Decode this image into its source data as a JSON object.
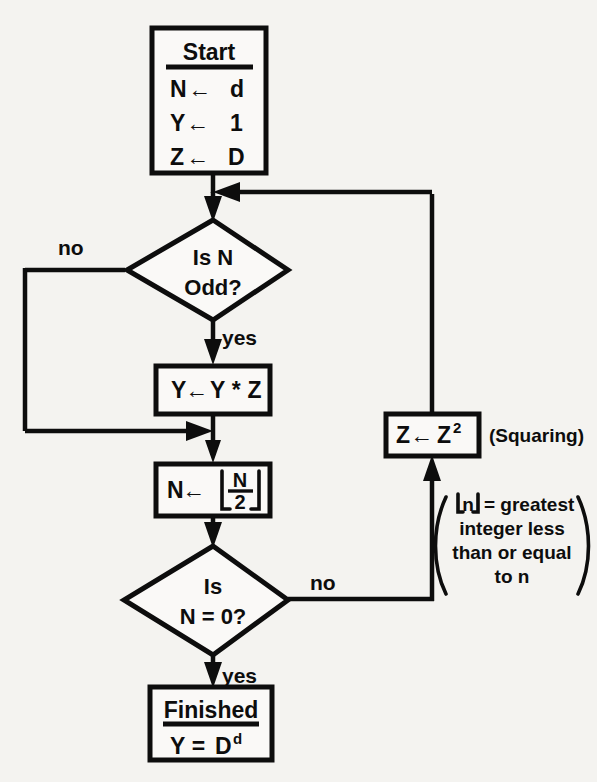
{
  "diagram": {
    "colors": {
      "background": "#f4f3f0",
      "ink": "#0d0d0d",
      "shape_fill": "#faf9f7"
    },
    "nodes": {
      "start": {
        "header": "Start",
        "lines": [
          "N",
          "d",
          "Y",
          "1",
          "Z",
          "D"
        ],
        "line1_left": "N",
        "line1_right": "d",
        "line2_left": "Y",
        "line2_right": "1",
        "line3_left": "Z",
        "line3_right": "D",
        "arrow_glyph": "←"
      },
      "decision_odd": {
        "line1": "Is N",
        "line2": "Odd?",
        "yes_label": "yes",
        "no_label": "no"
      },
      "multiply": {
        "left": "Y",
        "arrow_glyph": "←",
        "right": "Y * Z"
      },
      "halve": {
        "left": "N",
        "arrow_glyph": "←",
        "numerator": "N",
        "denominator": "2"
      },
      "decision_zero": {
        "line1": "Is",
        "line2": "N = 0?",
        "yes_label": "yes",
        "no_label": "no"
      },
      "square": {
        "left": "Z",
        "arrow_glyph": "←",
        "base": "Z",
        "exponent": "2",
        "caption": "(Squaring)"
      },
      "finished": {
        "header": "Finished",
        "expr_left": "Y =",
        "expr_base": "D",
        "expr_exponent": "d"
      }
    },
    "annotation": {
      "variable": "n",
      "line1_tail": "= greatest",
      "line2": "integer less",
      "line3": "than or equal",
      "line4": "to n"
    }
  }
}
